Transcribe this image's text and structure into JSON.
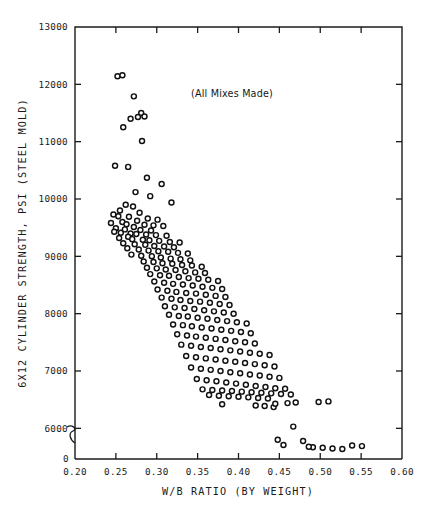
{
  "chart_data": {
    "type": "scatter",
    "title": "",
    "annotation": "(All Mixes Made)",
    "xlabel": "W/B RATIO (BY WEIGHT)",
    "ylabel": "6X12 CYLINDER STRENGTH, PSI (STEEL MOLD)",
    "xlim": [
      0.2,
      0.6
    ],
    "ylim": [
      5500,
      13000
    ],
    "y_axis_break": true,
    "y_zero_label": "0",
    "grid": false,
    "legend": null,
    "marker": "open-circle",
    "xticks": [
      0.2,
      0.25,
      0.3,
      0.35,
      0.4,
      0.45,
      0.5,
      0.55,
      0.6
    ],
    "xticklabels": [
      "0.20",
      "0.25",
      "0.30",
      "0.35",
      "0.40",
      "0.45",
      "0.50",
      "0.55",
      "0.60"
    ],
    "yticks": [
      6000,
      7000,
      8000,
      9000,
      10000,
      11000,
      12000,
      13000
    ],
    "yticklabels": [
      "6000",
      "7000",
      "8000",
      "9000",
      "10000",
      "11000",
      "12000",
      "13000"
    ],
    "n_points": 232,
    "x": [
      0.252,
      0.258,
      0.272,
      0.281,
      0.277,
      0.285,
      0.268,
      0.259,
      0.282,
      0.249,
      0.265,
      0.288,
      0.306,
      0.274,
      0.292,
      0.318,
      0.262,
      0.271,
      0.255,
      0.279,
      0.247,
      0.253,
      0.266,
      0.289,
      0.301,
      0.276,
      0.258,
      0.244,
      0.263,
      0.285,
      0.296,
      0.308,
      0.272,
      0.25,
      0.261,
      0.28,
      0.293,
      0.248,
      0.256,
      0.268,
      0.275,
      0.287,
      0.299,
      0.312,
      0.265,
      0.254,
      0.27,
      0.283,
      0.291,
      0.303,
      0.316,
      0.328,
      0.259,
      0.273,
      0.286,
      0.297,
      0.309,
      0.321,
      0.264,
      0.278,
      0.29,
      0.302,
      0.314,
      0.326,
      0.338,
      0.269,
      0.281,
      0.294,
      0.305,
      0.317,
      0.329,
      0.341,
      0.284,
      0.296,
      0.307,
      0.319,
      0.331,
      0.343,
      0.355,
      0.288,
      0.3,
      0.311,
      0.323,
      0.335,
      0.347,
      0.359,
      0.292,
      0.304,
      0.315,
      0.327,
      0.339,
      0.351,
      0.363,
      0.375,
      0.297,
      0.309,
      0.32,
      0.332,
      0.344,
      0.356,
      0.368,
      0.38,
      0.301,
      0.313,
      0.324,
      0.336,
      0.348,
      0.36,
      0.372,
      0.384,
      0.306,
      0.318,
      0.329,
      0.341,
      0.353,
      0.365,
      0.377,
      0.389,
      0.31,
      0.322,
      0.334,
      0.346,
      0.358,
      0.37,
      0.382,
      0.394,
      0.315,
      0.327,
      0.338,
      0.35,
      0.362,
      0.374,
      0.386,
      0.398,
      0.41,
      0.32,
      0.332,
      0.343,
      0.355,
      0.367,
      0.379,
      0.391,
      0.403,
      0.415,
      0.325,
      0.337,
      0.348,
      0.36,
      0.372,
      0.384,
      0.396,
      0.408,
      0.42,
      0.33,
      0.342,
      0.354,
      0.366,
      0.378,
      0.39,
      0.402,
      0.414,
      0.426,
      0.438,
      0.336,
      0.348,
      0.36,
      0.372,
      0.384,
      0.396,
      0.408,
      0.42,
      0.432,
      0.444,
      0.342,
      0.354,
      0.366,
      0.378,
      0.39,
      0.402,
      0.414,
      0.426,
      0.438,
      0.45,
      0.349,
      0.361,
      0.373,
      0.385,
      0.397,
      0.409,
      0.421,
      0.433,
      0.445,
      0.457,
      0.356,
      0.368,
      0.38,
      0.392,
      0.404,
      0.416,
      0.428,
      0.44,
      0.452,
      0.464,
      0.364,
      0.376,
      0.388,
      0.4,
      0.412,
      0.424,
      0.436,
      0.448,
      0.46,
      0.38,
      0.421,
      0.432,
      0.443,
      0.455,
      0.467,
      0.479,
      0.491,
      0.503,
      0.515,
      0.527,
      0.539,
      0.551,
      0.486,
      0.498,
      0.51,
      0.47,
      0.445,
      0.457,
      0.469
    ],
    "y": [
      12140,
      12160,
      11790,
      11500,
      11430,
      11440,
      11400,
      11250,
      11010,
      10580,
      10560,
      10370,
      10260,
      10120,
      10050,
      9940,
      9900,
      9870,
      9800,
      9760,
      9730,
      9700,
      9690,
      9660,
      9640,
      9620,
      9600,
      9580,
      9560,
      9550,
      9540,
      9530,
      9510,
      9490,
      9470,
      9460,
      9450,
      9430,
      9410,
      9400,
      9390,
      9380,
      9370,
      9360,
      9340,
      9320,
      9300,
      9290,
      9280,
      9270,
      9250,
      9240,
      9230,
      9210,
      9200,
      9180,
      9170,
      9160,
      9140,
      9120,
      9100,
      9090,
      9080,
      9060,
      9050,
      9030,
      9010,
      9000,
      8980,
      8960,
      8950,
      8930,
      8910,
      8900,
      8880,
      8870,
      8850,
      8840,
      8820,
      8800,
      8790,
      8770,
      8760,
      8740,
      8720,
      8710,
      8690,
      8670,
      8660,
      8640,
      8620,
      8610,
      8590,
      8570,
      8560,
      8540,
      8520,
      8510,
      8490,
      8470,
      8450,
      8430,
      8420,
      8400,
      8380,
      8360,
      8350,
      8330,
      8310,
      8290,
      8280,
      8260,
      8240,
      8220,
      8210,
      8190,
      8170,
      8150,
      8130,
      8110,
      8100,
      8080,
      8060,
      8040,
      8020,
      8000,
      7980,
      7960,
      7950,
      7930,
      7910,
      7890,
      7870,
      7850,
      7830,
      7810,
      7800,
      7780,
      7760,
      7740,
      7720,
      7700,
      7680,
      7660,
      7640,
      7620,
      7600,
      7580,
      7560,
      7540,
      7520,
      7500,
      7480,
      7460,
      7440,
      7420,
      7400,
      7380,
      7360,
      7340,
      7320,
      7300,
      7280,
      7260,
      7240,
      7220,
      7200,
      7180,
      7160,
      7140,
      7120,
      7100,
      7080,
      7060,
      7040,
      7020,
      7000,
      6980,
      6960,
      6940,
      6920,
      6900,
      6880,
      6860,
      6840,
      6820,
      6800,
      6780,
      6760,
      6740,
      6720,
      6700,
      6690,
      6680,
      6670,
      6660,
      6650,
      6640,
      6630,
      6620,
      6610,
      6600,
      6590,
      6580,
      6570,
      6560,
      6550,
      6540,
      6530,
      6520,
      5800,
      6440,
      6420,
      6400,
      6390,
      6370,
      5710,
      6030,
      5780,
      5670,
      5660,
      5650,
      5640,
      5700,
      5690,
      5680,
      6460,
      6470,
      6450,
      6430
    ]
  },
  "colors": {
    "background": "#ffffff",
    "axis": "#1b1b1b",
    "marker_stroke": "#111111",
    "marker_fill": "#ffffff",
    "text": "#1b1b1b"
  }
}
